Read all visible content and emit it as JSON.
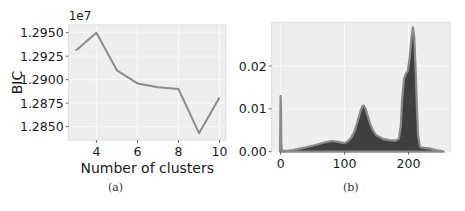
{
  "chart_data": [
    {
      "id": "a",
      "type": "line",
      "title": "",
      "xlabel": "Number of clusters",
      "ylabel": "BIC",
      "y_offset_label": "1e7",
      "x": [
        3,
        4,
        5,
        6,
        7,
        8,
        9,
        10
      ],
      "series": [
        {
          "name": "BIC",
          "values": [
            1.2931,
            1.295,
            1.291,
            1.2896,
            1.2892,
            1.289,
            1.2843,
            1.2881
          ],
          "color": "#8c8c8c"
        }
      ],
      "xticks": [
        4,
        6,
        8,
        10
      ],
      "xtick_labels": [
        "4",
        "6",
        "8",
        "10"
      ],
      "yticks": [
        1.285,
        1.2875,
        1.29,
        1.2925,
        1.295
      ],
      "ytick_labels": [
        "1.2850",
        "1.2875",
        "1.2900",
        "1.2925",
        "1.2950"
      ],
      "xlim": [
        2.65,
        10.3
      ],
      "ylim": [
        1.28358,
        1.29582
      ],
      "grid": true,
      "caption": "(a)"
    },
    {
      "id": "b",
      "type": "area",
      "title": "",
      "xlabel": "",
      "ylabel": "",
      "x": [
        -1,
        0,
        0.5,
        1,
        2,
        5,
        10,
        20,
        30,
        40,
        50,
        60,
        70,
        80,
        90,
        100,
        105,
        110,
        115,
        120,
        125,
        128,
        130,
        133,
        136,
        140,
        145,
        150,
        160,
        170,
        180,
        185,
        188,
        190,
        193,
        196,
        199,
        202,
        205,
        207,
        209,
        211,
        213,
        215,
        218,
        220,
        225,
        235,
        245,
        255
      ],
      "series": [
        {
          "name": "density",
          "values": [
            0,
            0.013,
            0.01,
            0.002,
            0.0003,
            0.0002,
            0.0002,
            0.0004,
            0.0007,
            0.001,
            0.0014,
            0.0018,
            0.0022,
            0.0025,
            0.0023,
            0.002,
            0.0024,
            0.0032,
            0.0045,
            0.0068,
            0.0095,
            0.0106,
            0.0108,
            0.01,
            0.0085,
            0.0065,
            0.0048,
            0.0038,
            0.003,
            0.0027,
            0.0026,
            0.003,
            0.006,
            0.012,
            0.017,
            0.0182,
            0.0188,
            0.022,
            0.027,
            0.029,
            0.027,
            0.02,
            0.011,
            0.004,
            0.0012,
            0.001,
            0.0009,
            0.0007,
            0.0003,
            0.0
          ],
          "fill": "#3f3f3f",
          "edge": "#8a8a8a"
        }
      ],
      "xticks": [
        0,
        100,
        200
      ],
      "xtick_labels": [
        "0",
        "100",
        "200"
      ],
      "yticks": [
        0.0,
        0.01,
        0.02
      ],
      "ytick_labels": [
        "0.00",
        "0.01",
        "0.02"
      ],
      "xlim": [
        -14,
        265
      ],
      "ylim": [
        0,
        0.0302
      ],
      "grid": true,
      "caption": "(b)"
    }
  ],
  "layout": {
    "a": {
      "left": 68.7,
      "top": 25,
      "right": 225.7,
      "bottom": 140
    },
    "b": {
      "left": 271.7,
      "top": 22.3,
      "right": 450,
      "bottom": 151.7
    }
  },
  "colors": {
    "plot_bg": "#eeeeee",
    "grid": "#fafafa",
    "frame": "#dcdcdc",
    "text": "#1a1a1a"
  }
}
